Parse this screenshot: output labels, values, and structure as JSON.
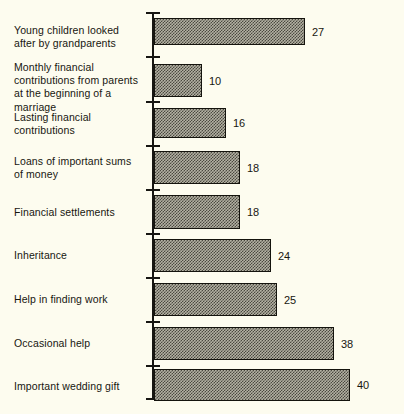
{
  "chart_data": {
    "type": "bar",
    "orientation": "horizontal",
    "title": "",
    "subtitle": "",
    "xlabel": "",
    "ylabel": "",
    "xlim": [
      0,
      40
    ],
    "grid": false,
    "legend": null,
    "axis": {
      "value_axis": "x",
      "category_axis": "y",
      "ticks_shown": true,
      "tick_labels_shown": false,
      "tick_count": 10
    },
    "categories": [
      "Young children looked\nafter by grandparents",
      "Monthly financial\ncontributions from parents\nat the beginning of a marriage",
      "Lasting financial\ncontributions",
      "Loans of important sums\nof money",
      "Financial settlements",
      "Inheritance",
      "Help in finding work",
      "Occasional help",
      "Important wedding gift"
    ],
    "values": [
      27,
      10,
      16,
      18,
      18,
      24,
      25,
      38,
      40
    ],
    "data_labels": [
      "27",
      "10",
      "16",
      "18",
      "18",
      "24",
      "25",
      "38",
      "40"
    ],
    "colors": {
      "background": "#fdfcef",
      "bar_fill": "#b3b1a3",
      "bar_pattern": "#4a4840",
      "bar_border": "#14130d",
      "axis": "#171612",
      "text": "#17160f"
    }
  },
  "rows": [
    {
      "label": "Young children looked\nafter by grandparents",
      "value": 27,
      "value_label": "27",
      "top": 14,
      "bar_top": 18,
      "bar_height": 27,
      "bar_width": 151,
      "label_top": 24
    },
    {
      "label": "Monthly financial\ncontributions from parents\nat the beginning of a marriage",
      "value": 10,
      "value_label": "10",
      "top": 58,
      "bar_top": 64,
      "bar_height": 33,
      "bar_width": 48,
      "label_top": 61
    },
    {
      "label": "Lasting financial\ncontributions",
      "value": 16,
      "value_label": "16",
      "top": 104,
      "bar_top": 108,
      "bar_height": 30,
      "bar_width": 72,
      "label_top": 111
    },
    {
      "label": "Loans of important sums\nof money",
      "value": 18,
      "value_label": "18",
      "top": 148,
      "bar_top": 151,
      "bar_height": 33,
      "bar_width": 86,
      "label_top": 155
    },
    {
      "label": "Financial settlements",
      "value": 18,
      "value_label": "18",
      "top": 194,
      "bar_top": 195,
      "bar_height": 34,
      "bar_width": 86,
      "label_top": 206
    },
    {
      "label": "Inheritance",
      "value": 24,
      "value_label": "24",
      "top": 238,
      "bar_top": 239,
      "bar_height": 33,
      "bar_width": 117,
      "label_top": 249
    },
    {
      "label": "Help in finding work",
      "value": 25,
      "value_label": "25",
      "top": 282,
      "bar_top": 283,
      "bar_height": 33,
      "bar_width": 123,
      "label_top": 293
    },
    {
      "label": "Occasional help",
      "value": 38,
      "value_label": "38",
      "top": 326,
      "bar_top": 327,
      "bar_height": 33,
      "bar_width": 180,
      "label_top": 337
    },
    {
      "label": "Important wedding gift",
      "value": 40,
      "value_label": "40",
      "top": 370,
      "bar_top": 369,
      "bar_height": 32,
      "bar_width": 196,
      "label_top": 380
    }
  ],
  "ticks": [
    12,
    56,
    101,
    145,
    189,
    233,
    277,
    321,
    365,
    398
  ]
}
